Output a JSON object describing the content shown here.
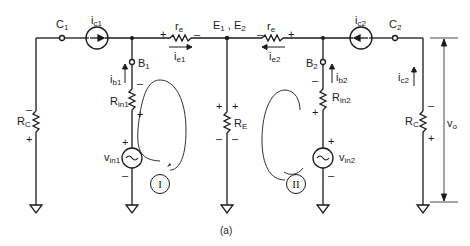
{
  "figure": {
    "caption": "(a)",
    "nodes": {
      "c1": {
        "main": "C",
        "sub": "1"
      },
      "c2": {
        "main": "C",
        "sub": "2"
      },
      "b1": {
        "main": "B",
        "sub": "1"
      },
      "b2": {
        "main": "B",
        "sub": "2"
      },
      "e12": {
        "text": "E",
        "sub1": "1",
        "sep": " , E",
        "sub2": "2"
      }
    },
    "currents": {
      "ic1": {
        "main": "i",
        "sub": "c1"
      },
      "ic2_top": {
        "main": "i",
        "sub": "c2"
      },
      "ic2_side": {
        "main": "i",
        "sub": "c2"
      },
      "ib1": {
        "main": "i",
        "sub": "b1"
      },
      "ib2": {
        "main": "i",
        "sub": "b2"
      },
      "ie1": {
        "main": "i",
        "sub": "e1"
      },
      "ie2": {
        "main": "i",
        "sub": "e2"
      }
    },
    "components": {
      "rc_left": {
        "main": "R",
        "sub": "C"
      },
      "rc_right": {
        "main": "R",
        "sub": "C"
      },
      "rin1": {
        "main": "R",
        "sub": "in1"
      },
      "rin2": {
        "main": "R",
        "sub": "in2"
      },
      "re": {
        "main": "R",
        "sub": "E"
      },
      "re1": {
        "main": "r",
        "sub": "e"
      },
      "re2": {
        "main": "r",
        "sub": "e"
      },
      "vin1": {
        "main": "v",
        "sub": "in1"
      },
      "vin2": {
        "main": "v",
        "sub": "in2"
      },
      "vo": {
        "main": "v",
        "sub": "o"
      }
    },
    "loops": {
      "loop1": "I",
      "loop2": "II"
    },
    "signs": {
      "plus": "+",
      "minus": "–"
    }
  }
}
